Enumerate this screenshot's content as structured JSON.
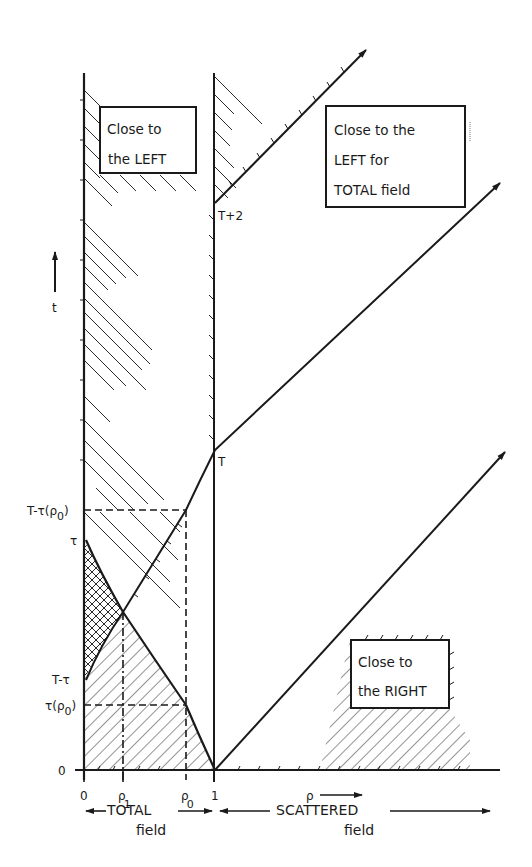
{
  "figure": {
    "type": "space-time diagram",
    "axes": {
      "vertical_label": "t",
      "horizontal_label": "ρ",
      "horizontal_ticks": [
        {
          "label": "0",
          "sub": ""
        },
        {
          "label": "ρ",
          "sub": "1"
        },
        {
          "label": "ρ",
          "sub": "0"
        },
        {
          "label": "1",
          "sub": ""
        }
      ],
      "vertical_ticks": [
        {
          "label": "T-τ(ρ",
          "sub": "0",
          "suffix": ")"
        },
        {
          "label": "τ",
          "sub": "",
          "suffix": ""
        },
        {
          "label": "T-τ",
          "sub": "",
          "suffix": ""
        },
        {
          "label": "τ(ρ",
          "sub": "0",
          "suffix": ")"
        },
        {
          "label": "0",
          "sub": "",
          "suffix": ""
        }
      ]
    },
    "point_labels": {
      "t_plus_2": "T+2",
      "t": "T"
    },
    "boxes": {
      "left": {
        "line1": "Close to",
        "line2": "the LEFT"
      },
      "left_total": {
        "line1": "Close to the",
        "line2": "LEFT for",
        "line3": "TOTAL field"
      },
      "right": {
        "line1": "Close to",
        "line2": "the RIGHT"
      }
    },
    "regions": {
      "total": {
        "line1": "TOTAL",
        "line2": "field"
      },
      "scattered": {
        "line1": "SCATTERED",
        "line2": "field"
      }
    },
    "colors": {
      "ink": "#1a1a1a",
      "background": "#ffffff"
    }
  }
}
